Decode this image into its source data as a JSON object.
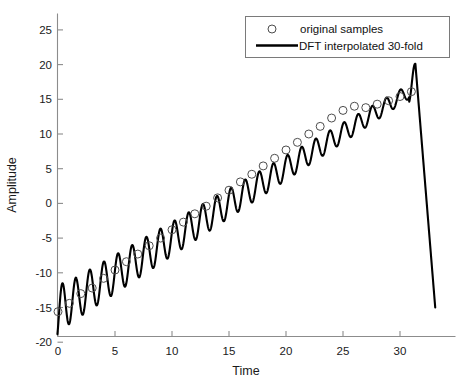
{
  "chart_data": {
    "type": "line",
    "title": "",
    "xlabel": "Time",
    "ylabel": "Amplitude",
    "xlim": [
      -0.6,
      33.2
    ],
    "ylim": [
      -21.5,
      27.0
    ],
    "xticks": [
      0,
      5,
      10,
      15,
      20,
      25,
      30
    ],
    "xticklabels": [
      "0",
      "5",
      "10",
      "15",
      "20",
      "25",
      "30"
    ],
    "yticks": [
      -20,
      -15,
      -10,
      -5,
      0,
      5,
      10,
      15,
      20,
      25
    ],
    "yticklabels": [
      "-20",
      "-15",
      "-10",
      "-5",
      "0",
      "5",
      "10",
      "15",
      "20",
      "25"
    ],
    "grid": false,
    "legend_position": "upper right",
    "series": [
      {
        "name": "original samples",
        "style": "marker",
        "marker": "circle",
        "color": "#4d4d4d",
        "x": [
          0,
          1,
          2,
          3,
          4,
          5,
          6,
          7,
          8,
          9,
          10,
          11,
          12,
          13,
          14,
          15,
          16,
          17,
          18,
          19,
          20,
          21,
          22,
          23,
          24,
          25,
          26,
          27,
          28,
          29,
          30,
          31
        ],
        "y": [
          -15.6,
          -14.4,
          -13.0,
          -12.2,
          -10.8,
          -9.6,
          -8.4,
          -7.3,
          -6.1,
          -5.0,
          -3.8,
          -2.7,
          -1.5,
          -0.4,
          0.8,
          1.9,
          3.1,
          4.2,
          5.4,
          6.5,
          7.7,
          8.8,
          10.0,
          11.1,
          12.3,
          13.4,
          14.0,
          13.8,
          14.3,
          14.8,
          15.4,
          16.1
        ]
      },
      {
        "name": "DFT interpolated 30-fold",
        "style": "line",
        "color": "#000000",
        "description": "ramp plus decaying-amplitude sinusoid, oscillation frequency about 0.8 cycles per time unit, rising from about -18 near t=0 to a peak near 20 at t=31.3 then falling steeply to about -15 at the right edge"
      }
    ],
    "signal_model": {
      "ramp_intercept": -15.3,
      "ramp_slope": 1.02,
      "osc_frequency_cycles_per_unit": 0.807,
      "osc_amplitude_start": 3.1,
      "osc_amplitude_end": 1.0,
      "sample_count": 32,
      "interpolation_factor": 30,
      "end_peak_value": 20.1,
      "end_peak_time": 31.35,
      "end_value": -15.2,
      "end_time": 33.1
    }
  },
  "legend": {
    "items": [
      {
        "label": "original samples",
        "glyph": "circle-marker"
      },
      {
        "label": "DFT interpolated 30-fold",
        "glyph": "solid-line"
      }
    ]
  }
}
